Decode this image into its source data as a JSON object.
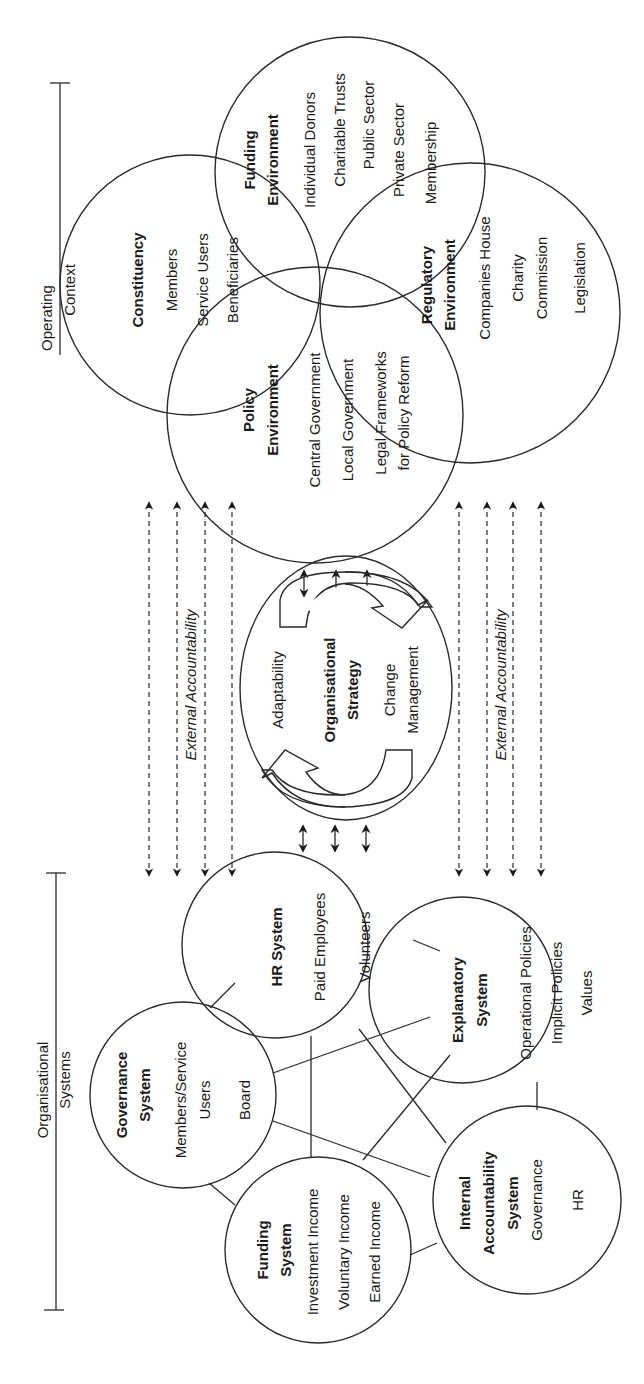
{
  "orientation": "rotated-90-ccw",
  "sections": {
    "operating_context": {
      "line1": "Operating",
      "line2": "Context"
    },
    "organisational_systems": {
      "line1": "Organisational",
      "line2": "Systems"
    }
  },
  "external_accountability": {
    "left_label": "External Accountability",
    "right_label": "External Accountability",
    "left_arrow_count": 4,
    "right_arrow_count": 4
  },
  "operating_context": {
    "constituency": {
      "title": "Constituency",
      "items": [
        "Members",
        "Service Users",
        "Beneficiaries"
      ]
    },
    "funding_environment": {
      "title_line1": "Funding",
      "title_line2": "Environment",
      "items": [
        "Individual Donors",
        "Charitable Trusts",
        "Public Sector",
        "Private Sector",
        "Membership"
      ]
    },
    "policy_environment": {
      "title_line1": "Policy",
      "title_line2": "Environment",
      "items": [
        "Central Government",
        "Local Government",
        "Legal Frameworks",
        "for Policy Reform"
      ]
    },
    "regulatory_environment": {
      "title_line1": "Regulatory",
      "title_line2": "Environment",
      "items": [
        "Companies House",
        "Charity",
        "Commission",
        "Legislation"
      ]
    }
  },
  "organisational_strategy": {
    "title_line1": "Organisational",
    "title_line2": "Strategy",
    "left_label": "Adaptability",
    "right_label_line1": "Change",
    "right_label_line2": "Management"
  },
  "organisational_systems": {
    "hr_system": {
      "title": "HR System",
      "items": [
        "Paid Employees",
        "Volunteers"
      ]
    },
    "governance_system": {
      "title_line1": "Governance",
      "title_line2": "System",
      "items": [
        "Members/Service",
        "Users",
        "Board"
      ]
    },
    "funding_system": {
      "title_line1": "Funding",
      "title_line2": "System",
      "items": [
        "Investment Income",
        "Voluntary Income",
        "Earned Income"
      ]
    },
    "explanatory_system": {
      "title_line1": "Explanatory",
      "title_line2": "System",
      "items": [
        "Operational Policies",
        "Implicit Policies",
        "Values"
      ]
    },
    "internal_accountability_system": {
      "title_line1": "Internal",
      "title_line2": "Accountability",
      "title_line3": "System",
      "items": [
        "Governance",
        "HR"
      ]
    }
  },
  "colors": {
    "line": "#2a2a2a",
    "text": "#1a1a1a",
    "background": "#ffffff"
  }
}
